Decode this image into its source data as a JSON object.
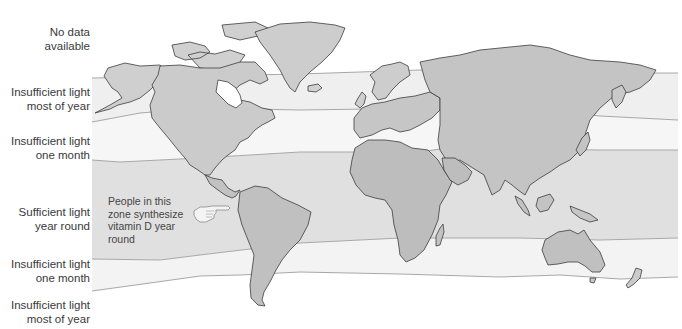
{
  "figure": {
    "bands": [
      {
        "id": "no-data",
        "label_line1": "No data",
        "label_line2": "available",
        "color": "#ffffff"
      },
      {
        "id": "insufficient-most-north",
        "label_line1": "Insufficient light",
        "label_line2": "most of year",
        "color": "#efefef"
      },
      {
        "id": "insufficient-month-north",
        "label_line1": "Insufficient light",
        "label_line2": "one month",
        "color": "#f7f7f7"
      },
      {
        "id": "sufficient",
        "label_line1": "Sufficient light",
        "label_line2": "year round",
        "color": "#e2e2e2"
      },
      {
        "id": "insufficient-month-south",
        "label_line1": "Insufficient light",
        "label_line2": "one month",
        "color": "#f3f3f3"
      },
      {
        "id": "insufficient-most-south",
        "label_line1": "Insufficient light",
        "label_line2": "most of year",
        "color": "#ffffff"
      }
    ],
    "callout": {
      "line1": "People in this",
      "line2": "zone synthesize",
      "line3": "vitamin D year",
      "line4": "round"
    },
    "colors": {
      "land": "#c9c9c9",
      "land_dark": "#b3b3b3",
      "coast": "#3c3c3c",
      "boundary": "#a8a8a8",
      "text": "#3a3a3a"
    }
  }
}
